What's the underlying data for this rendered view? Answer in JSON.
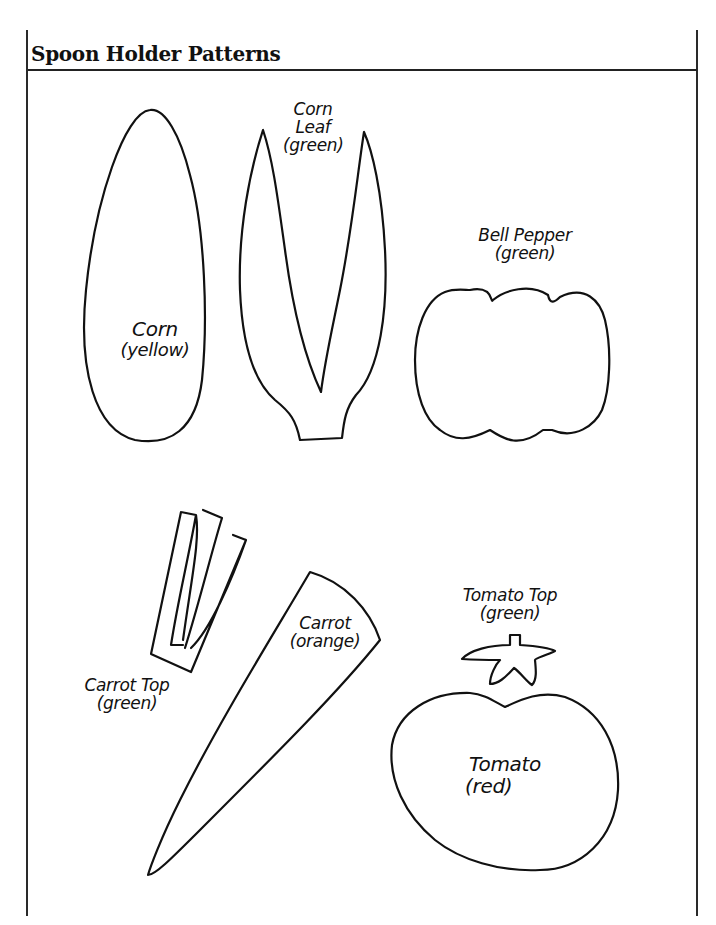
{
  "page": {
    "title": "Spoon Holder Patterns"
  },
  "patterns": [
    {
      "id": "corn",
      "name": "Corn",
      "color": "(yellow)"
    },
    {
      "id": "corn-leaf",
      "name_line1": "Corn",
      "name_line2": "Leaf",
      "color": "(green)"
    },
    {
      "id": "bell-pepper",
      "name": "Bell Pepper",
      "color": "(green)"
    },
    {
      "id": "carrot-top",
      "name": "Carrot Top",
      "color": "(green)"
    },
    {
      "id": "carrot",
      "name": "Carrot",
      "color": "(orange)"
    },
    {
      "id": "tomato-top",
      "name": "Tomato Top",
      "color": "(green)"
    },
    {
      "id": "tomato",
      "name": "Tomato",
      "color": "(red)"
    }
  ]
}
